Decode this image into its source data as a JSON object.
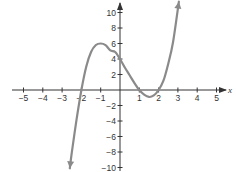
{
  "chart_data": {
    "type": "line",
    "title": "",
    "xlabel": "x",
    "ylabel": "",
    "xlim": [
      -5.5,
      5.5
    ],
    "ylim": [
      -10,
      11
    ],
    "grid": false,
    "x_ticks": [
      -5,
      -4,
      -3,
      -2,
      -1,
      1,
      2,
      3,
      4,
      5
    ],
    "y_ticks": [
      -10,
      -8,
      -6,
      -4,
      -2,
      2,
      4,
      6,
      8,
      10
    ],
    "x_tick_labels": [
      "−5",
      "−4",
      "−3",
      "−2",
      "−1",
      "1",
      "2",
      "3",
      "4",
      "5"
    ],
    "y_tick_labels": [
      "−10",
      "−8",
      "−6",
      "−4",
      "−2",
      "2",
      "4",
      "6",
      "8",
      "10"
    ],
    "series": [
      {
        "name": "f(x)",
        "description": "cubic with zeros at x = -2, 1, 2; y-intercept 4; local max near (-1, 6); local min near (1.5, -0.9); arrows on both ends",
        "x": [
          -2.6,
          -2.5,
          -2.25,
          -2,
          -1.75,
          -1.5,
          -1.25,
          -1,
          -0.75,
          -0.5,
          -0.25,
          0,
          0.25,
          0.5,
          0.75,
          1,
          1.25,
          1.5,
          1.75,
          2,
          2.25,
          2.5,
          2.75,
          3.05
        ],
        "y": [
          -10.1,
          -8.1,
          -3.8,
          0,
          3.0,
          4.9,
          5.8,
          6.0,
          5.8,
          5.1,
          4.9,
          4.0,
          2.9,
          1.9,
          0.9,
          0,
          -0.6,
          -0.9,
          -0.7,
          0,
          1.2,
          3.4,
          6.2,
          11.4
        ]
      }
    ],
    "colors": {
      "curve": "#8a8a8a",
      "axes": "#333333"
    }
  }
}
